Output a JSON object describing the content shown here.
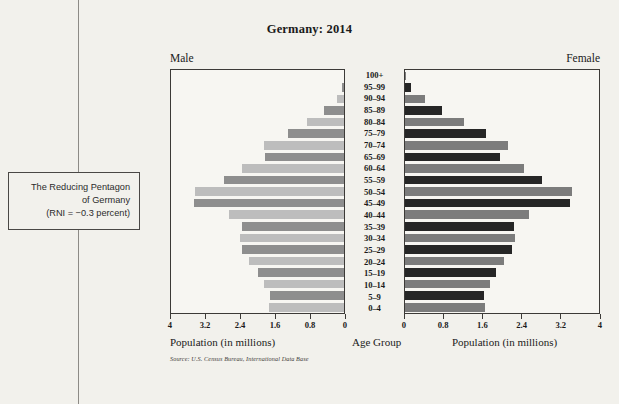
{
  "caption_box": {
    "line1": "The Reducing Pentagon",
    "line2": "of Germany",
    "line3": "(RNI = −0.3 percent)"
  },
  "figure": {
    "title": "Germany: 2014",
    "male_header": "Male",
    "female_header": "Female",
    "center_axis_label": "Age Group",
    "left_axis_label": "Population (in millions)",
    "right_axis_label": "Population (in millions)",
    "source": "Source: U.S. Census Bureau, International Data Base"
  },
  "colors": {
    "male_dark": "#8e8e8e",
    "male_light": "#bdbdbd",
    "female_dark": "#262626",
    "female_light": "#7c7c7c",
    "panel_background": "#f7f6f2",
    "page_background": "#f2f1ec",
    "rule": "#3c3a37"
  },
  "chart_data": {
    "type": "bar",
    "subtype": "population-pyramid",
    "title": "Germany: 2014",
    "xlabel": "Population (in millions)",
    "ylabel": "Age Group",
    "xlim": [
      0,
      4
    ],
    "xticks": [
      0,
      0.8,
      1.6,
      2.4,
      3.2,
      4
    ],
    "xtick_labels_left": [
      "4",
      "3.2",
      "2.4",
      "1.6",
      "0.8",
      "0"
    ],
    "xtick_labels_right": [
      "0",
      "0.8",
      "1.6",
      "2.4",
      "3.2",
      "4"
    ],
    "grid": false,
    "legend": "none",
    "categories": [
      "100+",
      "95–99",
      "90–94",
      "85–89",
      "80–84",
      "75–79",
      "70–74",
      "65–69",
      "60–64",
      "55–59",
      "50–54",
      "45–49",
      "40–44",
      "35–39",
      "30–34",
      "25–29",
      "20–24",
      "15–19",
      "10–14",
      "5–9",
      "0–4"
    ],
    "series": [
      {
        "name": "Male",
        "side": "left",
        "unit": "millions",
        "values": [
          0.01,
          0.04,
          0.17,
          0.46,
          0.86,
          1.3,
          1.86,
          1.83,
          2.35,
          2.78,
          3.45,
          3.47,
          2.65,
          2.35,
          2.4,
          2.35,
          2.2,
          1.98,
          1.85,
          1.72,
          1.73
        ]
      },
      {
        "name": "Female",
        "side": "right",
        "unit": "millions",
        "values": [
          0.02,
          0.13,
          0.41,
          0.77,
          1.22,
          1.66,
          2.13,
          1.96,
          2.45,
          2.83,
          3.44,
          3.4,
          2.56,
          2.25,
          2.26,
          2.2,
          2.05,
          1.88,
          1.76,
          1.63,
          1.64
        ]
      }
    ]
  }
}
